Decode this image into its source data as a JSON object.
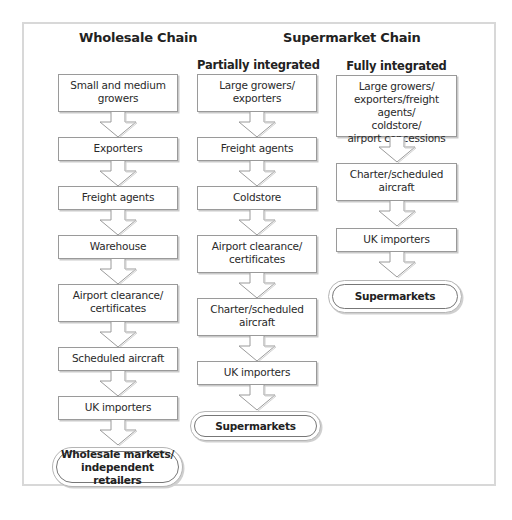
{
  "diagram": {
    "wholesale": {
      "title": "Wholesale Chain",
      "steps": [
        "Small and medium\ngrowers",
        "Exporters",
        "Freight agents",
        "Warehouse",
        "Airport clearance/\ncertificates",
        "Scheduled aircraft",
        "UK importers"
      ],
      "end": "Wholesale markets/\nindependent retailers"
    },
    "supermarket": {
      "title": "Supermarket Chain",
      "partial": {
        "title": "Partially integrated",
        "steps": [
          "Large growers/\nexporters",
          "Freight agents",
          "Coldstore",
          "Airport clearance/\ncertificates",
          "Charter/scheduled\naircraft",
          "UK importers"
        ],
        "end": "Supermarkets"
      },
      "full": {
        "title": "Fully integrated",
        "steps": [
          "Large growers/\nexporters/freight agents/\ncoldstore/\nairport concessions",
          "Charter/scheduled\naircraft",
          "UK importers"
        ],
        "end": "Supermarkets"
      }
    },
    "icons": {
      "flow_arrow": "down-arrow-icon"
    },
    "colors": {
      "border": "#9a9a9a",
      "frame": "#d8d8d8",
      "text": "#2a2a2a"
    }
  }
}
